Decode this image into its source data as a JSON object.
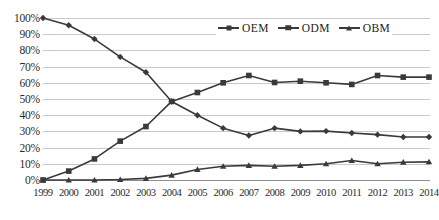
{
  "chart_data": {
    "type": "line",
    "title": "",
    "xlabel": "",
    "ylabel": "",
    "ylim": [
      0,
      100
    ],
    "ytick_labels": [
      "100%",
      "90%",
      "80%",
      "70%",
      "60%",
      "50%",
      "40%",
      "30%",
      "20%",
      "10%",
      "0%"
    ],
    "ytick_values": [
      100,
      90,
      80,
      70,
      60,
      50,
      40,
      30,
      20,
      10,
      0
    ],
    "grid": true,
    "legend_position": "top-center-right",
    "categories": [
      "1999",
      "2000",
      "2001",
      "2002",
      "2003",
      "2004",
      "2005",
      "2006",
      "2007",
      "2008",
      "2009",
      "2010",
      "2011",
      "2012",
      "2013",
      "2014"
    ],
    "series": [
      {
        "name": "OEM",
        "marker": "diamond",
        "color": "#3a3a3a",
        "values": [
          100,
          95.5,
          87,
          76,
          66.5,
          48.5,
          40,
          32,
          27.5,
          32,
          30,
          30.2,
          29,
          28,
          26.5,
          26.5
        ]
      },
      {
        "name": "ODM",
        "marker": "square",
        "color": "#3a3a3a",
        "values": [
          0,
          5.5,
          13,
          24,
          33,
          48.5,
          54,
          60,
          64.5,
          60.2,
          61,
          60,
          59,
          64.5,
          63.5,
          63.5
        ]
      },
      {
        "name": "OBM",
        "marker": "triangle",
        "color": "#3a3a3a",
        "values": [
          0,
          0,
          0,
          0.3,
          1,
          3,
          6.5,
          8.5,
          9,
          8.5,
          9,
          10,
          12,
          10,
          11,
          11.2
        ]
      }
    ]
  },
  "legend": {
    "items": [
      {
        "label": "OEM",
        "marker": "diamond"
      },
      {
        "label": "ODM",
        "marker": "square"
      },
      {
        "label": "OBM",
        "marker": "triangle"
      }
    ]
  }
}
